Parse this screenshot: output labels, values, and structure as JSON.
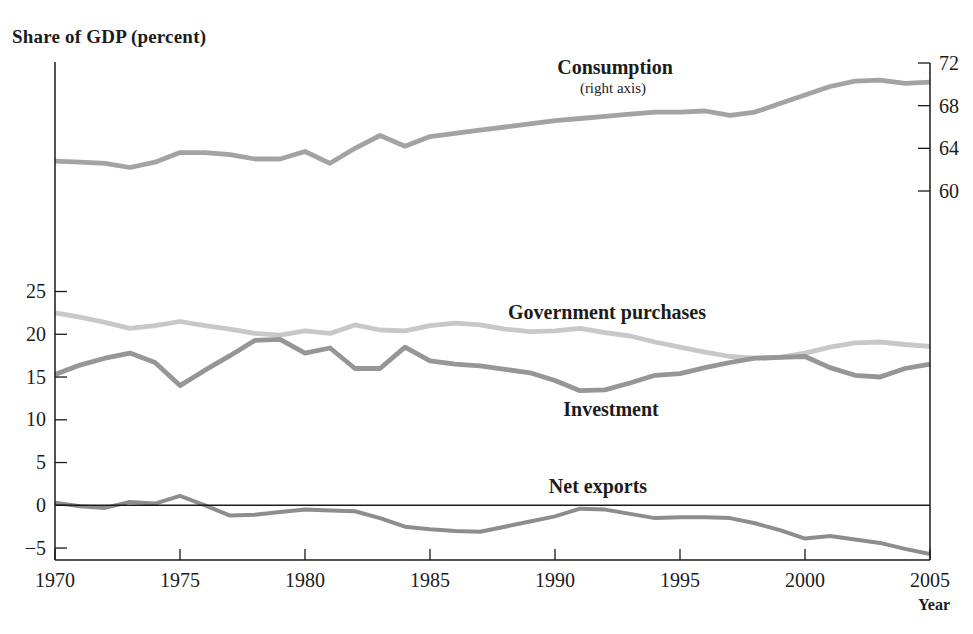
{
  "title": "Share of GDP (percent)",
  "xlabel": "Year",
  "labels": {
    "consumption": "Consumption",
    "consumption_note": "(right axis)",
    "government": "Government purchases",
    "investment": "Investment",
    "net_exports": "Net exports"
  },
  "colors": {
    "consumption": "#a3a3a3",
    "government": "#c8c8c8",
    "investment": "#969696",
    "net_exports": "#8d8d8d",
    "axis": "#1a1a1a",
    "text": "#1c1c1c"
  },
  "chart_data": {
    "type": "line",
    "title": "Share of GDP (percent)",
    "xlabel": "Year",
    "grid": false,
    "legend_position": "inline-labels",
    "x": [
      1970,
      1971,
      1972,
      1973,
      1974,
      1975,
      1976,
      1977,
      1978,
      1979,
      1980,
      1981,
      1982,
      1983,
      1984,
      1985,
      1986,
      1987,
      1988,
      1989,
      1990,
      1991,
      1992,
      1993,
      1994,
      1995,
      1996,
      1997,
      1998,
      1999,
      2000,
      2001,
      2002,
      2003,
      2004,
      2005
    ],
    "x_ticks": [
      1970,
      1975,
      1980,
      1985,
      1990,
      1995,
      2000,
      2005
    ],
    "left_axis": {
      "ticks": [
        25,
        20,
        15,
        10,
        5,
        0,
        -5
      ],
      "ylim": [
        -6.5,
        52
      ]
    },
    "right_axis": {
      "ticks": [
        72,
        68,
        64,
        60
      ],
      "ylim": [
        58.2,
        72.1
      ]
    },
    "zero_line_axis": "left",
    "series": [
      {
        "name": "Consumption",
        "axis": "right",
        "color_key": "consumption",
        "values": [
          62.8,
          62.7,
          62.6,
          62.2,
          62.7,
          63.6,
          63.6,
          63.4,
          63.0,
          63.0,
          63.7,
          62.6,
          64.0,
          65.2,
          64.2,
          65.1,
          65.4,
          65.7,
          66.0,
          66.3,
          66.6,
          66.8,
          67.0,
          67.2,
          67.4,
          67.4,
          67.5,
          67.1,
          67.4,
          68.2,
          69.0,
          69.8,
          70.3,
          70.4,
          70.1,
          70.2
        ]
      },
      {
        "name": "Government purchases",
        "axis": "left",
        "color_key": "government",
        "values": [
          22.5,
          22.0,
          21.4,
          20.7,
          21.0,
          21.5,
          21.0,
          20.6,
          20.1,
          19.9,
          20.4,
          20.1,
          21.1,
          20.5,
          20.4,
          21.0,
          21.3,
          21.1,
          20.6,
          20.3,
          20.4,
          20.7,
          20.2,
          19.8,
          19.1,
          18.5,
          17.9,
          17.4,
          17.2,
          17.3,
          17.8,
          18.5,
          19.0,
          19.1,
          18.8,
          18.6
        ]
      },
      {
        "name": "Investment",
        "axis": "left",
        "color_key": "investment",
        "values": [
          15.3,
          16.4,
          17.2,
          17.8,
          16.7,
          14.0,
          15.8,
          17.5,
          19.3,
          19.4,
          17.8,
          18.4,
          16.0,
          16.0,
          18.5,
          16.9,
          16.5,
          16.3,
          15.9,
          15.5,
          14.6,
          13.4,
          13.5,
          14.3,
          15.2,
          15.4,
          16.1,
          16.7,
          17.2,
          17.3,
          17.4,
          16.1,
          15.2,
          15.0,
          16.0,
          16.5
        ]
      },
      {
        "name": "Net exports",
        "axis": "left",
        "color_key": "net_exports",
        "values": [
          0.3,
          -0.1,
          -0.3,
          0.4,
          0.2,
          1.1,
          0.0,
          -1.2,
          -1.1,
          -0.8,
          -0.5,
          -0.6,
          -0.7,
          -1.5,
          -2.5,
          -2.8,
          -3.0,
          -3.1,
          -2.5,
          -1.9,
          -1.3,
          -0.4,
          -0.5,
          -1.0,
          -1.5,
          -1.4,
          -1.4,
          -1.5,
          -2.1,
          -2.9,
          -3.9,
          -3.6,
          -4.0,
          -4.4,
          -5.1,
          -5.7
        ]
      }
    ]
  }
}
